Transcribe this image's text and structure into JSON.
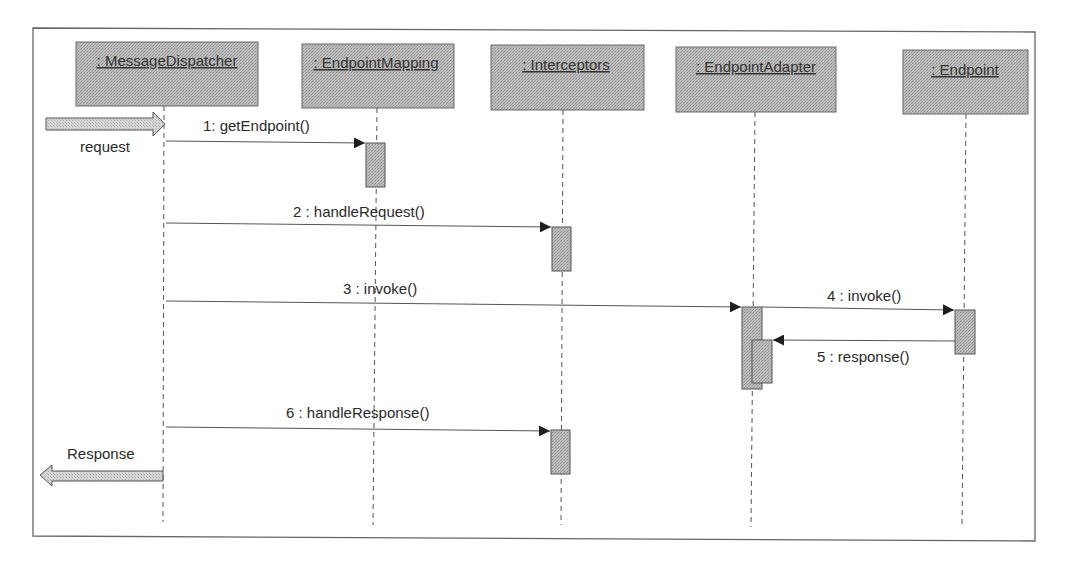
{
  "diagram": {
    "type": "uml-sequence",
    "participants": [
      {
        "id": "dispatcher",
        "label": ": MessageDispatcher",
        "x": 164,
        "box": [
          76,
          42,
          258,
          106
        ]
      },
      {
        "id": "mapping",
        "label": ": EndpointMapping",
        "x": 376,
        "box": [
          302,
          44,
          454,
          108
        ]
      },
      {
        "id": "interceptors",
        "label": ": Interceptors",
        "x": 563,
        "box": [
          491,
          45,
          644,
          110
        ]
      },
      {
        "id": "adapter",
        "label": ": EndpointAdapter",
        "x": 753,
        "box": [
          676,
          47,
          836,
          112
        ]
      },
      {
        "id": "endpoint",
        "label": ": Endpoint",
        "x": 966,
        "box": [
          903,
          50,
          1028,
          114
        ]
      }
    ],
    "messages": [
      {
        "id": "m1",
        "label": "1: getEndpoint()",
        "from": "dispatcher",
        "to": "mapping",
        "y1": 141,
        "y2": 143,
        "label_x": 260,
        "label_y": 131
      },
      {
        "id": "m2",
        "label": "2 : handleRequest()",
        "from": "dispatcher",
        "to": "interceptors",
        "y1": 223,
        "y2": 227,
        "label_x": 362,
        "label_y": 216
      },
      {
        "id": "m3",
        "label": "3 : invoke()",
        "from": "dispatcher",
        "to": "adapter",
        "y1": 301,
        "y2": 307,
        "label_x": 382,
        "label_y": 293
      },
      {
        "id": "m4",
        "label": "4 : invoke()",
        "from": "adapter",
        "to": "endpoint",
        "y1": 307,
        "y2": 310,
        "label_x": 867,
        "label_y": 300
      },
      {
        "id": "m5",
        "label": "5 : response()",
        "from": "endpoint",
        "to": "adapter",
        "y1": 341,
        "y2": 340,
        "label_x": 867,
        "label_y": 360
      },
      {
        "id": "m6",
        "label": "6 : handleResponse()",
        "from": "dispatcher",
        "to": "interceptors",
        "y1": 427,
        "y2": 431,
        "label_x": 361,
        "label_y": 417
      }
    ],
    "activations": [
      {
        "on": "mapping",
        "x": 366,
        "y": 143,
        "w": 19,
        "h": 44
      },
      {
        "on": "interceptors",
        "x": 552,
        "y": 227,
        "w": 19,
        "h": 44
      },
      {
        "on": "adapter",
        "x": 742,
        "y": 307,
        "w": 20,
        "h": 82
      },
      {
        "on": "adapter",
        "x": 752,
        "y": 340,
        "w": 20,
        "h": 43
      },
      {
        "on": "endpoint",
        "x": 955,
        "y": 310,
        "w": 20,
        "h": 44
      },
      {
        "on": "interceptors",
        "x": 551,
        "y": 430,
        "w": 19,
        "h": 44
      }
    ],
    "external": {
      "request_label": "request",
      "response_label": "Response"
    },
    "colors": {
      "box_fill": "#b4b4b4",
      "activation_fill": "#a9a9a9",
      "arrow_fill": "#cfcfcf",
      "line": "#555555",
      "frame": "#666666"
    }
  }
}
